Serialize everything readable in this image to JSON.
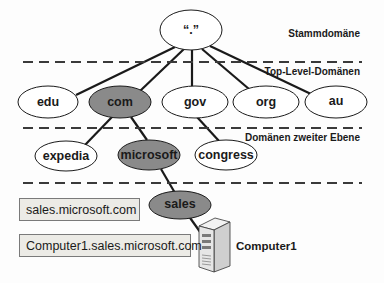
{
  "diagram": {
    "colors": {
      "highlight_fill": "#8a8a8a",
      "normal_fill": "#ffffff",
      "line": "#1a1a1a",
      "box_fill": "#ecebe6"
    },
    "levels": [
      {
        "label": "Stammdomäne"
      },
      {
        "label": "Top-Level-Domänen"
      },
      {
        "label": "Domänen zweiter Ebene"
      }
    ],
    "root": {
      "label": "“.”"
    },
    "tld_nodes": [
      {
        "label": "edu",
        "highlighted": false
      },
      {
        "label": "com",
        "highlighted": true
      },
      {
        "label": "gov",
        "highlighted": false
      },
      {
        "label": "org",
        "highlighted": false
      },
      {
        "label": "au",
        "highlighted": false
      }
    ],
    "second_level_nodes": [
      {
        "label": "expedia",
        "parent": "com",
        "highlighted": false
      },
      {
        "label": "microsoft",
        "parent": "com",
        "highlighted": true
      },
      {
        "label": "congress",
        "parent": "gov",
        "highlighted": false
      }
    ],
    "subdomain_node": {
      "label": "sales",
      "parent": "microsoft",
      "highlighted": true
    },
    "host": {
      "label": "Computer1",
      "icon": "server-icon"
    },
    "fqdn_boxes": [
      {
        "label": "sales.microsoft.com"
      },
      {
        "label": "Computer1.sales.microsoft.com"
      }
    ]
  }
}
